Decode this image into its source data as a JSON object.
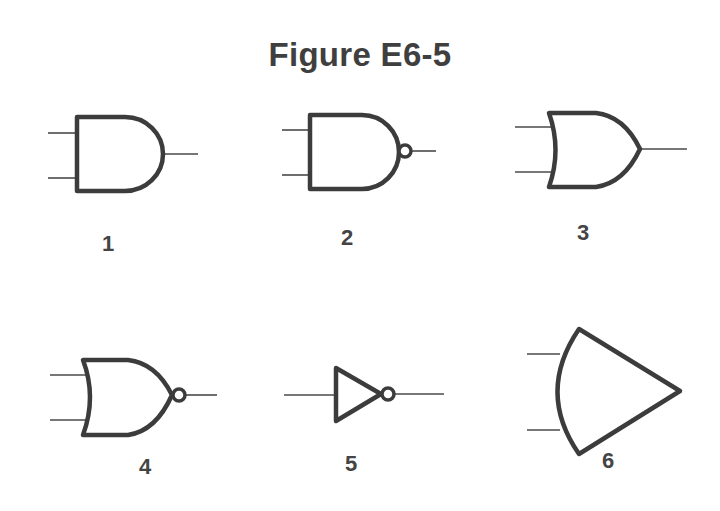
{
  "title": "Figure E6-5",
  "colors": {
    "stroke": "#3c3c3c",
    "text": "#3f3f3f",
    "background": "#ffffff"
  },
  "gates": [
    {
      "label": "1",
      "symbol": "and-gate-icon",
      "inputs": 2
    },
    {
      "label": "2",
      "symbol": "nand-gate-icon",
      "inputs": 2
    },
    {
      "label": "3",
      "symbol": "or-gate-icon",
      "inputs": 2
    },
    {
      "label": "4",
      "symbol": "nor-gate-icon",
      "inputs": 2
    },
    {
      "label": "5",
      "symbol": "not-gate-icon",
      "inputs": 1
    },
    {
      "label": "6",
      "symbol": "curved-triangle-gate-icon",
      "inputs": 2
    }
  ]
}
